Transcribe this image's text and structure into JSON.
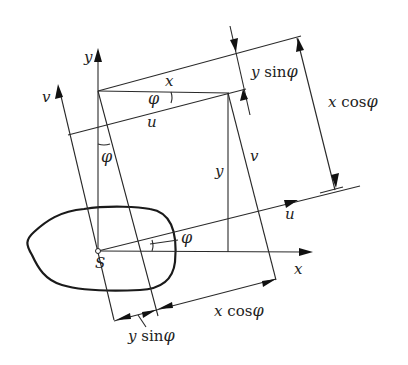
{
  "diagram": {
    "origin_label": "S",
    "axes": {
      "x": "x",
      "y": "y",
      "u": "u",
      "v": "v"
    },
    "segment_labels": {
      "x_top": "x",
      "u_top": "u",
      "y_mid": "y",
      "v_mid": "v"
    },
    "angle_labels": {
      "phi_top": "φ",
      "phi_left": "φ",
      "phi_right": "φ"
    },
    "dimension_labels": {
      "top_y_sin": {
        "var": "y",
        "fn": "sin",
        "angle": "φ"
      },
      "right_x_cos": {
        "var": "x",
        "fn": "cos",
        "angle": "φ"
      },
      "bottom_y_sin": {
        "var": "y",
        "fn": "sin",
        "angle": "φ"
      },
      "bottom_x_cos": {
        "var": "x",
        "fn": "cos",
        "angle": "φ"
      }
    },
    "colors": {
      "line": "#2a2a2a",
      "background": "#ffffff"
    }
  }
}
